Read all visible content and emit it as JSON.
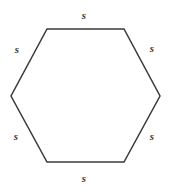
{
  "figure": {
    "name": "regular-hexagon-with-side-labels",
    "shape": "hexagon",
    "background_color": "#ffffff",
    "stroke_color": "#3a3a3a",
    "stroke_width": 1.5,
    "fill": "none",
    "label_color": "#3a3a3a",
    "vertices": [
      {
        "name": "top-left",
        "x": 47,
        "y": 29
      },
      {
        "name": "top-right",
        "x": 124,
        "y": 29
      },
      {
        "name": "right",
        "x": 160,
        "y": 96
      },
      {
        "name": "bottom-right",
        "x": 124,
        "y": 162
      },
      {
        "name": "bottom-left",
        "x": 47,
        "y": 162
      },
      {
        "name": "left",
        "x": 11,
        "y": 96
      }
    ],
    "labels": [
      {
        "id": "top",
        "text": "s",
        "x": 84,
        "y": 15
      },
      {
        "id": "upper-left",
        "text": "s",
        "x": 17,
        "y": 49
      },
      {
        "id": "upper-right",
        "text": "s",
        "x": 152,
        "y": 48
      },
      {
        "id": "lower-left",
        "text": "s",
        "x": 16,
        "y": 136
      },
      {
        "id": "lower-right",
        "text": "s",
        "x": 152,
        "y": 136
      },
      {
        "id": "bottom",
        "text": "s",
        "x": 84,
        "y": 178
      }
    ]
  }
}
